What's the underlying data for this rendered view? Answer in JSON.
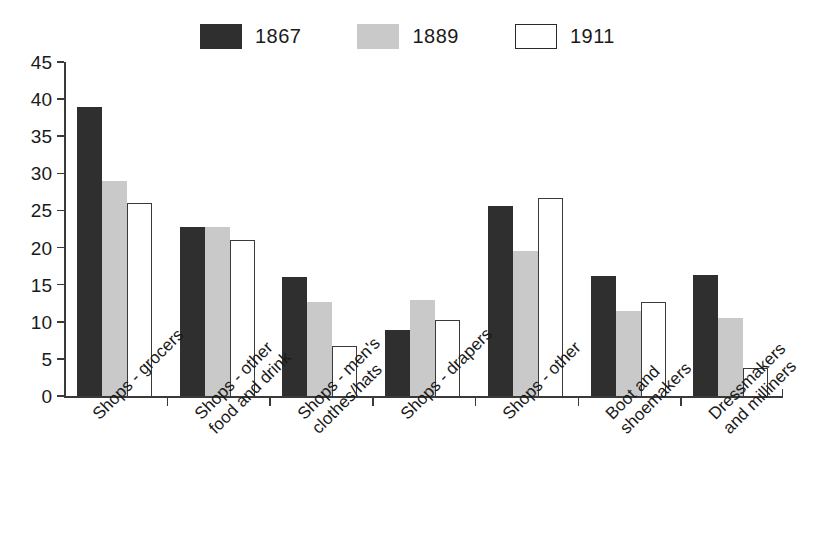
{
  "chart_data": {
    "type": "bar",
    "title": "",
    "subtitle": "",
    "xlabel": "",
    "ylabel": "",
    "ylim": [
      0,
      45
    ],
    "ytick_step": 5,
    "yticks": [
      0,
      5,
      10,
      15,
      20,
      25,
      30,
      35,
      40,
      45
    ],
    "grid": false,
    "legend_position": "top-center",
    "categories": [
      "Shops - grocers",
      "Shops - other\nfood and drink",
      "Shops - men's\nclothes/hats",
      "Shops - drapers",
      "Shops - other",
      "Boot and\nshoemakers",
      "Dressmakers\nand milliners"
    ],
    "series": [
      {
        "name": "1867",
        "color": "#2f2f2f",
        "values": [
          39.0,
          22.8,
          16.0,
          8.9,
          25.6,
          16.2,
          16.3
        ]
      },
      {
        "name": "1889",
        "color": "#c9c9c9",
        "values": [
          29.0,
          22.8,
          12.7,
          12.9,
          19.5,
          11.5,
          10.5
        ]
      },
      {
        "name": "1911",
        "color": "#ffffff",
        "values": [
          26.0,
          21.0,
          6.7,
          10.2,
          26.7,
          12.7,
          3.8
        ]
      }
    ]
  },
  "legend": {
    "items": [
      {
        "label": "1867",
        "swatch": "filled-dark-swatch"
      },
      {
        "label": "1889",
        "swatch": "filled-gray-swatch"
      },
      {
        "label": "1911",
        "swatch": "outlined-white-swatch"
      }
    ]
  },
  "axis": {
    "y_tick_labels": [
      "45",
      "40",
      "35",
      "30",
      "25",
      "20",
      "15",
      "10",
      "5",
      "0"
    ]
  }
}
